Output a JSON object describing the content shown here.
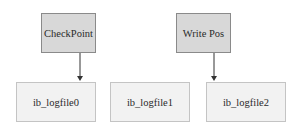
{
  "diagram": {
    "pointers": [
      {
        "label": "CheckPoint",
        "points_to": "ib_logfile0"
      },
      {
        "label": "Write Pos",
        "points_to": "ib_logfile2"
      }
    ],
    "files": [
      {
        "label": "ib_logfile0"
      },
      {
        "label": "ib_logfile1"
      },
      {
        "label": "ib_logfile2"
      }
    ],
    "colors": {
      "pointer_fill": "#d8d8d8",
      "pointer_border": "#8a8a8a",
      "file_fill": "#f2f2f2",
      "file_border": "#c4c4c4",
      "arrow": "#333333"
    }
  }
}
